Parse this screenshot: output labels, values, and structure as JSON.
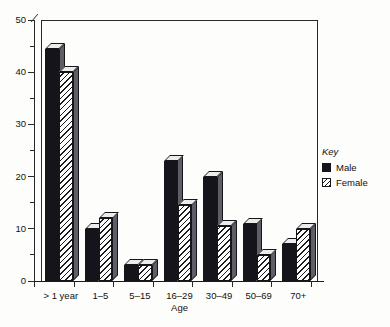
{
  "chart_data": {
    "type": "bar",
    "title": "",
    "xlabel": "Age",
    "ylabel": "",
    "ylim": [
      0,
      50
    ],
    "ytick_step": 10,
    "yminor_step": 5,
    "grid": false,
    "legend_position": "right",
    "categories": [
      "> 1 year",
      "1–5",
      "5–15",
      "16–29",
      "30–49",
      "50–69",
      "70+"
    ],
    "yticks": [
      "0",
      "10",
      "20",
      "30",
      "40",
      "50"
    ],
    "series": [
      {
        "name": "Male",
        "values": [
          44.5,
          10.0,
          3.0,
          23.0,
          20.0,
          11.0,
          7.0
        ]
      },
      {
        "name": "Female",
        "values": [
          40.0,
          12.0,
          3.0,
          14.5,
          10.5,
          5.0,
          10.0
        ]
      }
    ]
  },
  "legend": {
    "title": "Key",
    "items": [
      {
        "label": "Male",
        "swatch": "solid-black-swatch"
      },
      {
        "label": "Female",
        "swatch": "diagonal-hatch-swatch"
      }
    ]
  },
  "colors": {
    "male_fill": "#14141a",
    "female_hatch": "#1b1b1b",
    "bar_outline": "#15151a",
    "bar_top_face": "#ececec",
    "bar_side_face": "#5e5e66",
    "axis": "#2a2a2a",
    "background": "#fdfdfb"
  }
}
